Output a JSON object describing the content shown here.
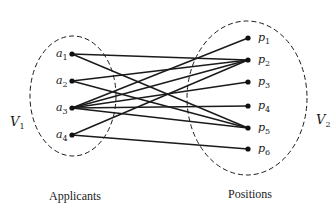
{
  "diagram": {
    "type": "bipartite-graph",
    "left_set": {
      "label": "V",
      "label_sub": "1",
      "caption": "Applicants",
      "nodes": [
        {
          "id": "a1",
          "label": "a",
          "sub": "1",
          "x": 72,
          "y": 54
        },
        {
          "id": "a2",
          "label": "a",
          "sub": "2",
          "x": 72,
          "y": 81
        },
        {
          "id": "a3",
          "label": "a",
          "sub": "3",
          "x": 72,
          "y": 108
        },
        {
          "id": "a4",
          "label": "a",
          "sub": "4",
          "x": 72,
          "y": 135
        }
      ]
    },
    "right_set": {
      "label": "V",
      "label_sub": "2",
      "caption": "Positions",
      "nodes": [
        {
          "id": "p1",
          "label": "p",
          "sub": "1",
          "x": 248,
          "y": 38
        },
        {
          "id": "p2",
          "label": "p",
          "sub": "2",
          "x": 248,
          "y": 60
        },
        {
          "id": "p3",
          "label": "p",
          "sub": "3",
          "x": 248,
          "y": 82
        },
        {
          "id": "p4",
          "label": "p",
          "sub": "4",
          "x": 248,
          "y": 106
        },
        {
          "id": "p5",
          "label": "p",
          "sub": "5",
          "x": 248,
          "y": 128
        },
        {
          "id": "p6",
          "label": "p",
          "sub": "6",
          "x": 248,
          "y": 149
        }
      ]
    },
    "edges": [
      [
        "a1",
        "p2"
      ],
      [
        "a1",
        "p5"
      ],
      [
        "a2",
        "p2"
      ],
      [
        "a2",
        "p5"
      ],
      [
        "a3",
        "p1"
      ],
      [
        "a3",
        "p2"
      ],
      [
        "a3",
        "p3"
      ],
      [
        "a3",
        "p4"
      ],
      [
        "a3",
        "p5"
      ],
      [
        "a4",
        "p2"
      ],
      [
        "a4",
        "p6"
      ]
    ]
  }
}
